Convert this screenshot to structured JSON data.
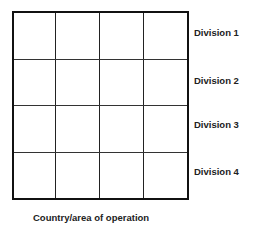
{
  "diagram": {
    "type": "grid-matrix",
    "rows": 4,
    "columns": 4,
    "row_labels": [
      "Division 1",
      "Division 2",
      "Division 3",
      "Division 4"
    ],
    "x_axis_caption": "Country/area of operation"
  }
}
